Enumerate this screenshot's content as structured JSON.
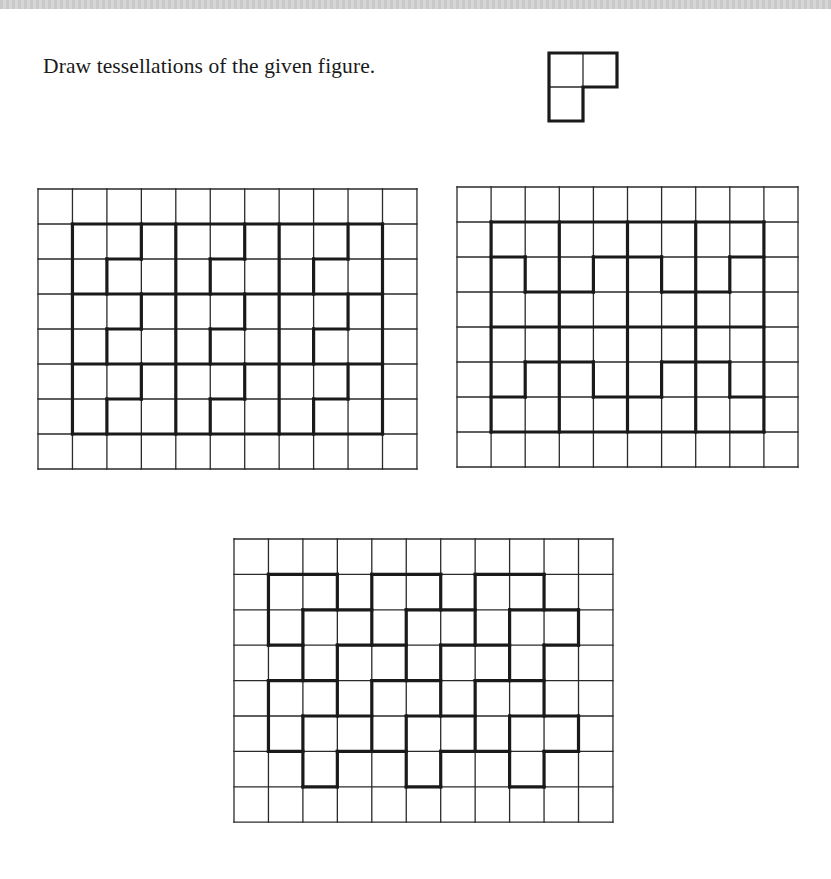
{
  "page": {
    "instruction": "Draw tessellations of the given figure."
  },
  "given_figure": {
    "name": "L-tromino",
    "x": 549,
    "y": 53,
    "cell": 34,
    "cells": [
      [
        0,
        0
      ],
      [
        1,
        0
      ],
      [
        0,
        1
      ]
    ]
  },
  "grids": [
    {
      "name": "tessellation-grid-1",
      "x": 38,
      "y": 189,
      "cols": 11,
      "rows": 8,
      "cw": 34.45,
      "ch": 35,
      "thick_h": [
        [
          1,
          1,
          10
        ],
        [
          2,
          2,
          3
        ],
        [
          2,
          5,
          6
        ],
        [
          2,
          8,
          9
        ],
        [
          3,
          1,
          10
        ],
        [
          4,
          2,
          3
        ],
        [
          4,
          5,
          6
        ],
        [
          4,
          8,
          9
        ],
        [
          5,
          1,
          10
        ],
        [
          6,
          2,
          3
        ],
        [
          6,
          5,
          6
        ],
        [
          6,
          8,
          9
        ],
        [
          7,
          1,
          10
        ]
      ],
      "thick_v": [
        [
          1,
          1,
          7
        ],
        [
          4,
          1,
          7
        ],
        [
          7,
          1,
          7
        ],
        [
          10,
          1,
          7
        ],
        [
          3,
          1,
          2
        ],
        [
          3,
          3,
          4
        ],
        [
          3,
          5,
          6
        ],
        [
          6,
          1,
          2
        ],
        [
          6,
          3,
          4
        ],
        [
          6,
          5,
          6
        ],
        [
          9,
          1,
          2
        ],
        [
          9,
          3,
          4
        ],
        [
          9,
          5,
          6
        ],
        [
          2,
          2,
          3
        ],
        [
          2,
          4,
          5
        ],
        [
          2,
          6,
          7
        ],
        [
          5,
          2,
          3
        ],
        [
          5,
          4,
          5
        ],
        [
          5,
          6,
          7
        ],
        [
          8,
          2,
          3
        ],
        [
          8,
          4,
          5
        ],
        [
          8,
          6,
          7
        ]
      ]
    },
    {
      "name": "tessellation-grid-2",
      "x": 457,
      "y": 187,
      "cols": 10,
      "rows": 8,
      "cw": 34.1,
      "ch": 35,
      "thick_h": [
        [
          1,
          1,
          9
        ],
        [
          2,
          1,
          2
        ],
        [
          2,
          4,
          6
        ],
        [
          2,
          8,
          9
        ],
        [
          3,
          2,
          4
        ],
        [
          3,
          6,
          8
        ],
        [
          4,
          1,
          9
        ],
        [
          5,
          2,
          4
        ],
        [
          5,
          6,
          8
        ],
        [
          6,
          1,
          2
        ],
        [
          6,
          4,
          6
        ],
        [
          6,
          8,
          9
        ],
        [
          7,
          1,
          9
        ]
      ],
      "thick_v": [
        [
          1,
          1,
          7
        ],
        [
          3,
          1,
          7
        ],
        [
          5,
          1,
          7
        ],
        [
          7,
          1,
          7
        ],
        [
          9,
          1,
          7
        ],
        [
          2,
          2,
          3
        ],
        [
          2,
          5,
          6
        ],
        [
          4,
          2,
          3
        ],
        [
          4,
          5,
          6
        ],
        [
          6,
          2,
          3
        ],
        [
          6,
          5,
          6
        ],
        [
          8,
          2,
          3
        ],
        [
          8,
          5,
          6
        ]
      ]
    },
    {
      "name": "tessellation-grid-3",
      "x": 234,
      "y": 539,
      "cols": 11,
      "rows": 8,
      "cw": 34.45,
      "ch": 35.4,
      "thick_h": [
        [
          1,
          1,
          3
        ],
        [
          1,
          4,
          6
        ],
        [
          1,
          7,
          9
        ],
        [
          2,
          2,
          4
        ],
        [
          2,
          5,
          7
        ],
        [
          2,
          8,
          10
        ],
        [
          3,
          1,
          2
        ],
        [
          3,
          3,
          5
        ],
        [
          3,
          6,
          8
        ],
        [
          3,
          9,
          10
        ],
        [
          4,
          1,
          3
        ],
        [
          4,
          4,
          6
        ],
        [
          4,
          7,
          9
        ],
        [
          5,
          2,
          4
        ],
        [
          5,
          5,
          7
        ],
        [
          5,
          8,
          10
        ],
        [
          6,
          1,
          2
        ],
        [
          6,
          3,
          5
        ],
        [
          6,
          6,
          8
        ],
        [
          6,
          9,
          10
        ],
        [
          7,
          2,
          3
        ],
        [
          7,
          5,
          6
        ],
        [
          7,
          8,
          9
        ]
      ],
      "thick_v": [
        [
          1,
          1,
          3
        ],
        [
          1,
          4,
          6
        ],
        [
          2,
          2,
          4
        ],
        [
          2,
          5,
          7
        ],
        [
          3,
          1,
          2
        ],
        [
          3,
          3,
          5
        ],
        [
          3,
          6,
          7
        ],
        [
          4,
          1,
          3
        ],
        [
          4,
          4,
          6
        ],
        [
          5,
          2,
          4
        ],
        [
          5,
          5,
          7
        ],
        [
          6,
          1,
          2
        ],
        [
          6,
          3,
          5
        ],
        [
          6,
          6,
          7
        ],
        [
          7,
          1,
          3
        ],
        [
          7,
          4,
          6
        ],
        [
          8,
          2,
          4
        ],
        [
          8,
          5,
          7
        ],
        [
          9,
          1,
          2
        ],
        [
          9,
          3,
          5
        ],
        [
          9,
          6,
          7
        ],
        [
          10,
          2,
          3
        ],
        [
          10,
          5,
          6
        ]
      ]
    }
  ],
  "colors": {
    "ink": "#1a1a1a",
    "thin_line": "#2a2a2a",
    "background": "#ffffff",
    "top_band": "#cccccc"
  }
}
